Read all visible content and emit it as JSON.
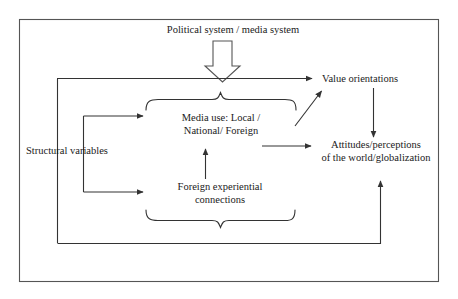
{
  "diagram": {
    "title_node": "Political system / media system",
    "nodes": {
      "value_orientations": "Value orientations",
      "media_use": "Media use: Local /\nNational/ Foreign",
      "structural_variables": "Structural variables",
      "attitudes": "Attitudes/perceptions\nof the world/globalization",
      "foreign_connections": "Foreign experiential\nconnections"
    },
    "connectors": [
      {
        "name": "political-system-to-model",
        "style": "block-arrow",
        "direction": "down"
      },
      {
        "name": "structural-variables-to-value-orientations",
        "style": "line-arrow",
        "direction": "right"
      },
      {
        "name": "structural-variables-to-media-use",
        "style": "line-arrow",
        "direction": "right"
      },
      {
        "name": "structural-variables-to-foreign-connections",
        "style": "line-arrow",
        "direction": "right"
      },
      {
        "name": "foreign-connections-to-media-use",
        "style": "line-arrow",
        "direction": "up"
      },
      {
        "name": "media-group-to-value-orientations",
        "style": "line-arrow",
        "direction": "diagonal-up-right"
      },
      {
        "name": "media-group-to-attitudes",
        "style": "line-arrow",
        "direction": "right"
      },
      {
        "name": "value-orientations-to-attitudes",
        "style": "line-arrow",
        "direction": "down"
      },
      {
        "name": "feedback-to-attitudes",
        "style": "line-arrow",
        "direction": "up"
      }
    ],
    "braces": [
      {
        "name": "upper-brace",
        "orientation": "up"
      },
      {
        "name": "lower-brace",
        "orientation": "down"
      }
    ],
    "colors": {
      "stroke": "#333333",
      "border": "#555555",
      "background": "#ffffff",
      "text": "#1a1a1a"
    }
  }
}
